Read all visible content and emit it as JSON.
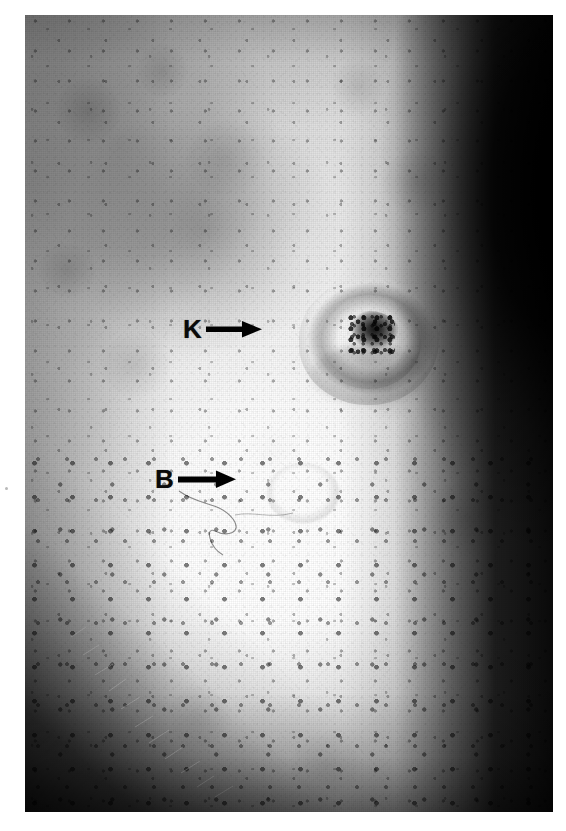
{
  "figure": {
    "kind": "clinical-photograph",
    "modality": "grayscale halftone print",
    "background_color": "#ffffff",
    "photo_frame": {
      "left": 25,
      "top": 15,
      "width": 528,
      "height": 797,
      "base_tone": "#e8e8e8",
      "highlight_tone": "#fdfdfd",
      "shadow_tone": "#0b0b0b"
    }
  },
  "annotations": [
    {
      "id": "k",
      "label": "K",
      "arrow": "right-arrow",
      "label_color": "#0a0a0a",
      "arrow_color": "#000000",
      "points_to": "crateriform keratotic nodule",
      "target_x": 345,
      "target_y": 326
    },
    {
      "id": "b",
      "label": "B",
      "arrow": "right-arrow",
      "label_color": "#0a0a0a",
      "arrow_color": "#000000",
      "points_to": "small flat papule",
      "target_x": 278,
      "target_y": 478
    }
  ],
  "features": {
    "lesion_k": {
      "name": "central crateriform lesion",
      "center_x": 344,
      "center_y": 326,
      "rim": "raised pale border",
      "core": "dark keratotic plug",
      "core_color": "#1a1a1a"
    },
    "lesion_b": {
      "name": "secondary subtle papule",
      "center_x": 278,
      "center_y": 478,
      "appearance": "faint pale-rimmed macule"
    },
    "skin": {
      "pores": "numerous dark follicular openings, denser inferiorly",
      "hairs": "fine vellus hairs visible along lower-left shadow band",
      "vignette": "dark contour shadow along right edge and lower-left fold"
    }
  }
}
